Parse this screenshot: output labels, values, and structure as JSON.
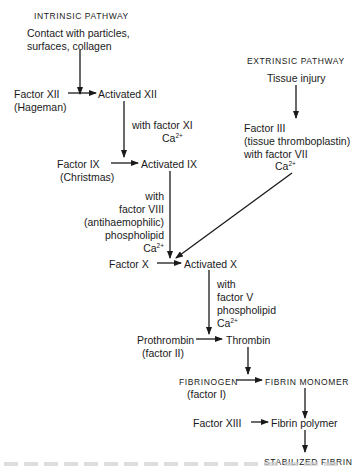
{
  "diagram": {
    "type": "coagulation-cascade",
    "intrinsic": {
      "title": "INTRINSIC PATHWAY",
      "trigger_line1": "Contact with particles,",
      "trigger_line2": "surfaces, collagen",
      "factor_xii": "Factor XII",
      "factor_xii_alias": "(Hageman)",
      "activated_xii": "Activated XII",
      "cofactor_xi_line1": "with factor XI",
      "cofactor_xi_ca": "Ca",
      "factor_ix": "Factor IX",
      "factor_ix_alias": "(Christmas)",
      "activated_ix": "Activated IX",
      "cofactor_viii_line1": "with",
      "cofactor_viii_line2": "factor VIII",
      "cofactor_viii_line3": "(antihaemophilic)",
      "cofactor_viii_line4": "phospholipid",
      "cofactor_viii_ca": "Ca"
    },
    "extrinsic": {
      "title": "EXTRINSIC PATHWAY",
      "trigger": "Tissue injury",
      "factor_iii": "Factor III",
      "factor_iii_alias": "(tissue thromboplastin)",
      "with_vii": "with factor VII",
      "ca": "Ca"
    },
    "common": {
      "factor_x": "Factor X",
      "activated_x": "Activated X",
      "cofactor_v_line1": "with",
      "cofactor_v_line2": "factor V",
      "cofactor_v_line3": "phospholipid",
      "cofactor_v_ca": "Ca",
      "prothrombin": "Prothrombin",
      "prothrombin_alias": "(factor II)",
      "thrombin": "Thrombin",
      "fibrinogen": "FIBRINOGEN",
      "fibrinogen_alias": "(factor I)",
      "fibrin_monomer": "FIBRIN MONOMER",
      "factor_xiii": "Factor XIII",
      "fibrin_polymer": "Fibrin polymer",
      "stabilized_fibrin": "STABILIZED FIBRIN"
    },
    "calcium_superscript": "2+",
    "line_color": "#1a1a1a"
  }
}
